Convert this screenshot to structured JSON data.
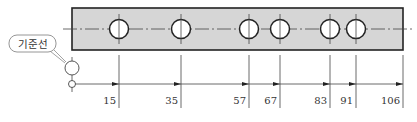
{
  "diagram": {
    "type": "engineering-drawing",
    "colors": {
      "plate_fill": "#d6d6d6",
      "line": "#222222",
      "thin_line": "#444444",
      "text": "#333333",
      "callout_border": "#8a8a8a"
    },
    "callout": {
      "label": "기준선"
    },
    "dimensions": {
      "unit": "mm",
      "origin": 0,
      "values": [
        "15",
        "35",
        "57",
        "67",
        "83",
        "91",
        "106"
      ]
    },
    "holes": [
      {
        "position": 15
      },
      {
        "position": 35
      },
      {
        "position": 57
      },
      {
        "position": 67
      },
      {
        "position": 83
      },
      {
        "position": 91
      }
    ],
    "plate_length": 106
  }
}
